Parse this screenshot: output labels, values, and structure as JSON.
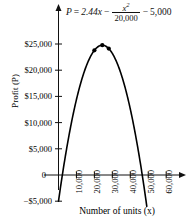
{
  "chart_data": {
    "type": "line",
    "title": "",
    "equation_text": "P = 2.44x - x^2/20,000 - 5,000",
    "equation_parts": {
      "lhs": "P",
      "equals": "=",
      "term1": "2.44x",
      "minus1": "−",
      "frac_num": "x",
      "frac_num_exp": "2",
      "frac_den": "20,000",
      "minus2": "−",
      "term3": "5,000"
    },
    "xlabel": "Number of units (x)",
    "ylabel": "Profit (P)",
    "xlim": [
      -4000,
      68000
    ],
    "ylim": [
      -6500,
      27500
    ],
    "grid": false,
    "legend": "none",
    "xticks": [
      10000,
      20000,
      30000,
      40000,
      50000,
      60000
    ],
    "xticklabels": [
      "10,000",
      "20,000",
      "30,000",
      "40,000",
      "50,000",
      "60,000"
    ],
    "yticks": [
      -5000,
      0,
      5000,
      10000,
      15000,
      20000,
      25000
    ],
    "yticklabels": [
      "−$5,000",
      "0",
      "$5,000",
      "$10,000",
      "$15,000",
      "$20,000",
      "$25,000"
    ],
    "x": [
      0,
      2000,
      4000,
      6000,
      8000,
      10000,
      12000,
      14000,
      16000,
      18000,
      20000,
      22000,
      24400,
      26000,
      28000,
      30000,
      32000,
      34000,
      36000,
      38000,
      40000,
      42000,
      44000,
      46000,
      48000,
      48800
    ],
    "values": [
      -5000,
      -80,
      4960,
      9840,
      14560,
      19120,
      13520,
      24160,
      24440,
      18760,
      23800,
      29680,
      24768,
      29640,
      24480,
      23200,
      22560,
      20720,
      18720,
      16560,
      14240,
      11760,
      9120,
      6320,
      3360,
      2512
    ],
    "series": [
      {
        "name": "Profit curve",
        "y_formula": "P = 2.44x - x^2/20000 - 5000",
        "color": "#000000"
      }
    ],
    "markers": [
      {
        "x": 20000,
        "y": 23800,
        "label": ""
      },
      {
        "x": 24400,
        "y": 24768,
        "label": ""
      },
      {
        "x": 28000,
        "y": 24480,
        "label": ""
      }
    ],
    "x_intercepts": [
      2102,
      46698
    ],
    "vertex": {
      "x": 24400,
      "y": 24768
    },
    "axis_arrows": {
      "x": "right",
      "y": "up"
    },
    "line_color": "#000000",
    "axis_color": "#111111"
  }
}
